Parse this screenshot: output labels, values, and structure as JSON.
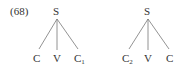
{
  "example_number": "(68)",
  "trees": [
    {
      "root": "S",
      "leaves": [
        {
          "label": "C",
          "sub": ""
        },
        {
          "label": "V",
          "sub": ""
        },
        {
          "label": "C",
          "sub": "1"
        }
      ]
    },
    {
      "root": "S",
      "leaves": [
        {
          "label": "C",
          "sub": "2"
        },
        {
          "label": "V",
          "sub": ""
        },
        {
          "label": "C",
          "sub": ""
        }
      ]
    }
  ]
}
